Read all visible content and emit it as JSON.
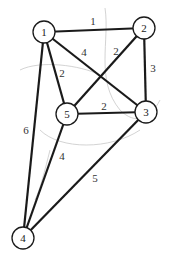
{
  "diagram": {
    "type": "weighted-undirected-graph",
    "nodes": [
      {
        "id": "1",
        "label": "1"
      },
      {
        "id": "2",
        "label": "2"
      },
      {
        "id": "3",
        "label": "3"
      },
      {
        "id": "4",
        "label": "4"
      },
      {
        "id": "5",
        "label": "5"
      }
    ],
    "edges": [
      {
        "from": "1",
        "to": "2",
        "weight": "1"
      },
      {
        "from": "1",
        "to": "3",
        "weight": "4"
      },
      {
        "from": "1",
        "to": "5",
        "weight": "2"
      },
      {
        "from": "1",
        "to": "4",
        "weight": "6"
      },
      {
        "from": "2",
        "to": "5",
        "weight": "2"
      },
      {
        "from": "2",
        "to": "3",
        "weight": "3"
      },
      {
        "from": "5",
        "to": "3",
        "weight": "2"
      },
      {
        "from": "5",
        "to": "4",
        "weight": "4"
      },
      {
        "from": "3",
        "to": "4",
        "weight": "5"
      }
    ]
  }
}
